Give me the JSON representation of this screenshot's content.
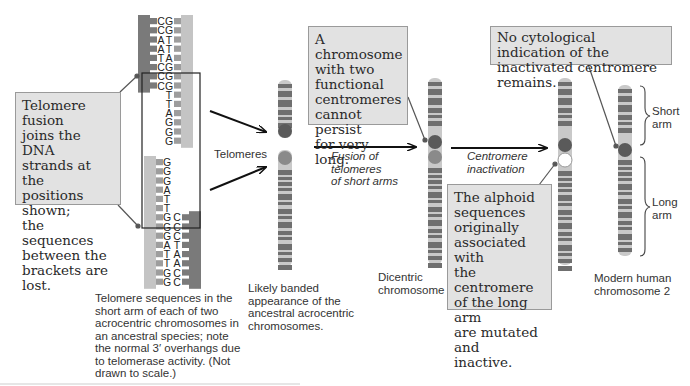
{
  "dna": {
    "top_strand_left": [
      "C",
      "C",
      "A",
      "A",
      "T",
      "C",
      "C",
      "C"
    ],
    "top_strand_right": [
      "G",
      "G",
      "T",
      "T",
      "A",
      "G",
      "G",
      "G",
      "T",
      "T",
      "A",
      "G",
      "G",
      "G"
    ],
    "bottom_strand_left": [
      "G",
      "G",
      "G",
      "A",
      "T",
      "T",
      "G",
      "G",
      "G",
      "A",
      "T",
      "T",
      "G",
      "G"
    ],
    "bottom_strand_right": [
      "C",
      "C",
      "C",
      "T",
      "A",
      "A",
      "C",
      "C"
    ],
    "caption": "Telomere sequences in the short arm of each of two acrocentric chromosomes in an ancestral species; note the normal 3′ overhangs due to telomerase activity. (Not drawn to scale.)",
    "caption_lines": [
      "Telomere sequences in the",
      "short arm of each of two",
      "acrocentric chromosomes in",
      "an ancestral species; note",
      "the normal 3′ overhangs due",
      "to telomerase activity. (Not",
      "drawn to scale.)"
    ]
  },
  "callouts": {
    "fusion": {
      "text": "Telomere fusion joins the DNA strands at the positions shown; the sequences between the brackets are lost.",
      "lines": [
        "Telomere fusion",
        "joins the DNA",
        "strands at the",
        "positions shown;",
        "the sequences",
        "between the",
        "brackets are lost."
      ]
    },
    "dicentric": {
      "text": "A chromosome with two functional centromeres cannot persist for very long.",
      "lines": [
        "A chromosome",
        "with two",
        "functional",
        "centromeres",
        "cannot persist",
        "for very long."
      ]
    },
    "alphoid": {
      "text": "The alphoid sequences originally associated with the centromere of the long arm are mutated and inactive.",
      "lines": [
        "The alphoid",
        "sequences",
        "originally",
        "associated with",
        "the centromere",
        "of the long arm",
        "are mutated and",
        "inactive."
      ]
    },
    "no_indication": {
      "text": "No cytological indication of the inactivated centromere remains.",
      "lines": [
        "No cytological indication of the",
        "inactivated centromere remains."
      ]
    }
  },
  "labels": {
    "telomeres": "Telomeres",
    "ancestral_caption_lines": [
      "Likely banded",
      "appearance of the",
      "ancestral acrocentric",
      "chromosomes."
    ],
    "fusion_step_lines": [
      "Fusion of",
      "telomeres",
      "of short arms"
    ],
    "inactivation_step_lines": [
      "Centromere",
      "inactivation"
    ],
    "dicentric_caption_lines": [
      "Dicentric",
      "chromosome"
    ],
    "modern_caption_lines": [
      "Modern human",
      "chromosome 2"
    ],
    "short_arm_lines": [
      "Short",
      "arm"
    ],
    "long_arm_lines": [
      "Long",
      "arm"
    ]
  },
  "colors": {
    "band_dark": "#6f6f6f",
    "band_light": "#c9c9c9",
    "centromere": "#5a5a5a",
    "centromere_faded": "#8a8a8a",
    "strand_dark": "#7a7a7a",
    "strand_light": "#c4c4c4",
    "callout_bg": "#e2e2e2"
  }
}
